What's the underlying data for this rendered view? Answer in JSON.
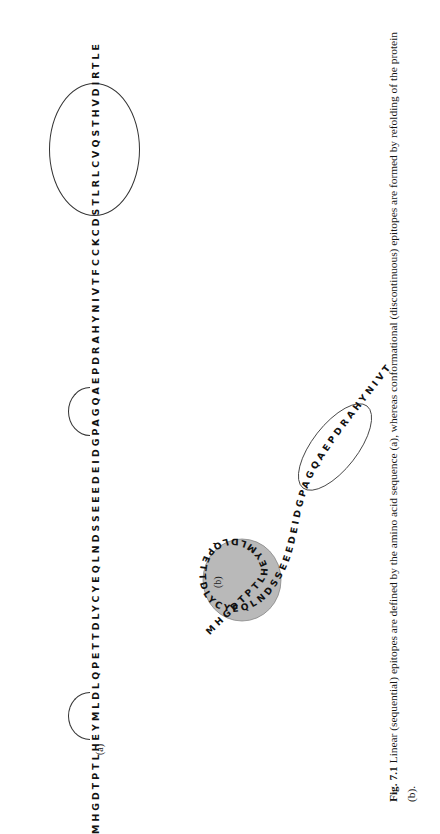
{
  "figure": {
    "number": "Fig. 7.1",
    "caption_line1": "Linear (sequential) epitopes are defined by the amino acid sequence (a), whereas conformational (discontinuous)",
    "caption_line2": "epitopes are formed by refolding of the protein (b).",
    "caption_full": "Linear (sequential) epitopes are defined by the amino acid sequence (a), whereas conformational (discontinuous) epitopes are formed by refolding of the protein (b)."
  },
  "panels": {
    "a": {
      "label": "(a)",
      "sequence": "MHGDTPTLHEYMLDLQPETTDLYCYEQLNDSSEEEDEIDGPAGQAEPDRAHYNIVTFCCKCDSTLRLCVQSTHVDIRTLE",
      "sequence_length": 79,
      "epitope_markers": [
        {
          "type": "arc",
          "label": "linear-epitope-1",
          "residues": "LHEYM",
          "start_index": 8,
          "end_index": 12
        },
        {
          "type": "arc",
          "label": "linear-epitope-2",
          "residues": "DGPAG",
          "start_index": 37,
          "end_index": 42
        },
        {
          "type": "ellipse",
          "label": "linear-epitope-3",
          "residues": "STLRLCVQSTH",
          "start_index": 61,
          "end_index": 72
        }
      ]
    },
    "b": {
      "label": "(b)",
      "sequence": "MHGDTPTLHEYMLDLQPETTDLYCYEQLNDSSEEEDEIDGPAGQAEPDRAHYNIVTFCCKCDSTLRLCVQSTHVDIRTLE",
      "conformational_epitope_fill": "#9e9e9e",
      "markers": [
        {
          "type": "blob",
          "label": "conformational-epitope-shaded",
          "color": "#9e9e9e"
        },
        {
          "type": "ellipse",
          "label": "linear-epitope-ellipse",
          "residues": "STLRLCVQSTH"
        }
      ]
    }
  },
  "colors": {
    "page_background": "#ffffff",
    "text": "#111111",
    "stroke": "#333333",
    "epitope_shade": "#9e9e9e"
  }
}
